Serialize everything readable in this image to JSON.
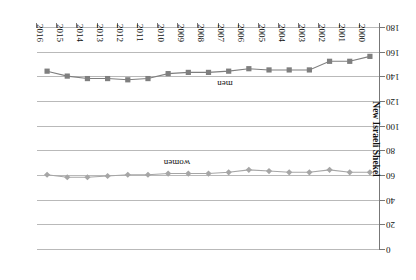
{
  "chart_data": {
    "type": "line",
    "title": "",
    "orientation_note": "image is rotated 180 degrees",
    "xlabel": "Years",
    "ylabel": "New Israeli Shekel",
    "grid": true,
    "legend_position": "inline",
    "ylim": [
      0,
      180
    ],
    "ytick_step": 20,
    "yticks": [
      0,
      20,
      40,
      60,
      80,
      100,
      120,
      140,
      160,
      180
    ],
    "categories": [
      "2000",
      "2001",
      "2002",
      "2003",
      "2004",
      "2005",
      "2006",
      "2007",
      "2008",
      "2009",
      "2010",
      "2011",
      "2012",
      "2013",
      "2014",
      "2015",
      "2016"
    ],
    "x_axis_display_order": [
      "2016",
      "2015",
      "2014",
      "2013",
      "2012",
      "2011",
      "2010",
      "2009",
      "2008",
      "2007",
      "2006",
      "2005",
      "2004",
      "2003",
      "2002",
      "2001",
      "2000"
    ],
    "series": [
      {
        "name": "men",
        "marker": "square",
        "color": "#7f7f7f",
        "values": [
          157,
          153,
          153,
          146,
          146,
          146,
          147,
          145,
          144,
          144,
          143,
          139,
          138,
          139,
          139,
          141,
          145
        ]
      },
      {
        "name": "women",
        "marker": "diamond",
        "color": "#a6a6a6",
        "values": [
          63,
          63,
          65,
          63,
          63,
          64,
          65,
          63,
          62,
          62,
          62,
          61,
          61,
          60,
          59,
          59,
          61
        ]
      }
    ]
  },
  "axis": {
    "y_title": "New Israeli Shekel",
    "x_title": "Years"
  },
  "labels": {
    "men": "men",
    "women": "women"
  }
}
